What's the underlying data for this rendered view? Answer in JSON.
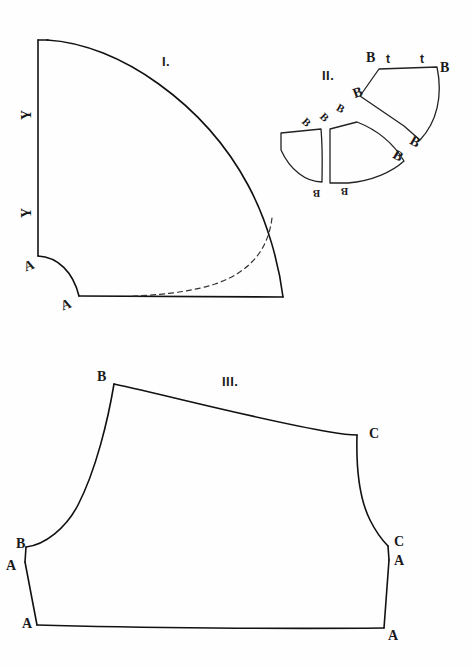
{
  "plate": {
    "background_color": "#fefefe",
    "ink_color": "#111111",
    "width": 472,
    "height": 667
  },
  "figures": [
    {
      "id": "figure-one",
      "label": "I.",
      "label_x": 162,
      "label_y": 54,
      "description": "Quarter-circle pattern piece with notched lower-left corner and dashed interior guide curve",
      "point_labels": [
        {
          "text": "Y",
          "x": 22,
          "y": 107,
          "rotation": "rot90"
        },
        {
          "text": "Y",
          "x": 22,
          "y": 205,
          "rotation": "rot90"
        },
        {
          "text": "A",
          "x": 24,
          "y": 258,
          "rotation": "rotm20"
        },
        {
          "text": "A",
          "x": 61,
          "y": 297,
          "rotation": "rotm20"
        }
      ]
    },
    {
      "id": "figure-two",
      "label": "II.",
      "label_x": 322,
      "label_y": 68,
      "description": "Three separated gore / gusset pattern pieces with matching B notch labels and t markings",
      "point_labels": [
        {
          "text": "B",
          "x": 366,
          "y": 50,
          "rotation": ""
        },
        {
          "text": "t",
          "x": 386,
          "y": 50,
          "rotation": "bold-t"
        },
        {
          "text": "t",
          "x": 420,
          "y": 50,
          "rotation": "bold-t"
        },
        {
          "text": "B",
          "x": 440,
          "y": 60,
          "rotation": ""
        },
        {
          "text": "B",
          "x": 353,
          "y": 85,
          "rotation": "rotm20"
        },
        {
          "text": "B",
          "x": 337,
          "y": 102,
          "rotation": "rot30"
        },
        {
          "text": "B",
          "x": 321,
          "y": 111,
          "rotation": "rot45"
        },
        {
          "text": "B",
          "x": 303,
          "y": 116,
          "rotation": "rot45"
        },
        {
          "text": "B",
          "x": 410,
          "y": 134,
          "rotation": "rot30"
        },
        {
          "text": "B",
          "x": 393,
          "y": 148,
          "rotation": "rot30"
        },
        {
          "text": "B",
          "x": 313,
          "y": 188,
          "rotation": "rot180"
        },
        {
          "text": "B",
          "x": 341,
          "y": 186,
          "rotation": "rot180"
        }
      ]
    },
    {
      "id": "figure-three",
      "label": "III.",
      "label_x": 222,
      "label_y": 374,
      "description": "Sleeve / bodice pattern piece with B, C and A construction points marked at the corners",
      "point_labels": [
        {
          "text": "B",
          "x": 97,
          "y": 369,
          "rotation": ""
        },
        {
          "text": "C",
          "x": 369,
          "y": 426,
          "rotation": ""
        },
        {
          "text": "B",
          "x": 16,
          "y": 536,
          "rotation": ""
        },
        {
          "text": "A",
          "x": 6,
          "y": 558,
          "rotation": ""
        },
        {
          "text": "C",
          "x": 394,
          "y": 534,
          "rotation": ""
        },
        {
          "text": "A",
          "x": 394,
          "y": 553,
          "rotation": ""
        },
        {
          "text": "A",
          "x": 22,
          "y": 616,
          "rotation": ""
        },
        {
          "text": "A",
          "x": 388,
          "y": 628,
          "rotation": ""
        }
      ]
    }
  ]
}
